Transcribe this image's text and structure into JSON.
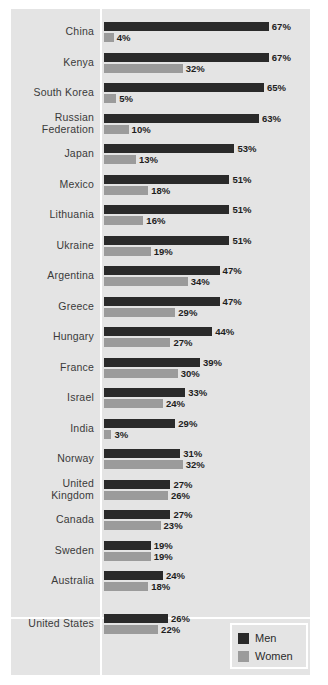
{
  "chart_data": {
    "type": "bar",
    "orientation": "horizontal",
    "title": "",
    "subtitle": "",
    "xlabel": "",
    "ylabel": "",
    "grid": false,
    "xlim": [
      0,
      70
    ],
    "value_suffix": "%",
    "legend_position": "bottom-right",
    "categories": [
      "China",
      "Kenya",
      "South Korea",
      "Russian Federation",
      "Japan",
      "Mexico",
      "Lithuania",
      "Ukraine",
      "Argentina",
      "Greece",
      "Hungary",
      "France",
      "Israel",
      "India",
      "Norway",
      "United Kingdom",
      "Canada",
      "Sweden",
      "Australia",
      "United States"
    ],
    "series": [
      {
        "name": "Men",
        "color": "#2a2a2a",
        "values": [
          67,
          67,
          65,
          63,
          53,
          51,
          51,
          51,
          47,
          47,
          44,
          39,
          33,
          29,
          31,
          27,
          27,
          19,
          24,
          26
        ]
      },
      {
        "name": "Women",
        "color": "#9b9b9b",
        "values": [
          4,
          32,
          5,
          10,
          13,
          18,
          16,
          19,
          34,
          29,
          27,
          30,
          24,
          3,
          32,
          26,
          23,
          19,
          18,
          22
        ]
      }
    ]
  },
  "rows": [
    {
      "label_lines": [
        "China"
      ],
      "men": "67%",
      "women": "4%"
    },
    {
      "label_lines": [
        "Kenya"
      ],
      "men": "67%",
      "women": "32%"
    },
    {
      "label_lines": [
        "South Korea"
      ],
      "men": "65%",
      "women": "5%"
    },
    {
      "label_lines": [
        "Russian",
        "Federation"
      ],
      "men": "63%",
      "women": "10%"
    },
    {
      "label_lines": [
        "Japan"
      ],
      "men": "53%",
      "women": "13%"
    },
    {
      "label_lines": [
        "Mexico"
      ],
      "men": "51%",
      "women": "18%"
    },
    {
      "label_lines": [
        "Lithuania"
      ],
      "men": "51%",
      "women": "16%"
    },
    {
      "label_lines": [
        "Ukraine"
      ],
      "men": "51%",
      "women": "19%"
    },
    {
      "label_lines": [
        "Argentina"
      ],
      "men": "47%",
      "women": "34%"
    },
    {
      "label_lines": [
        "Greece"
      ],
      "men": "47%",
      "women": "29%"
    },
    {
      "label_lines": [
        "Hungary"
      ],
      "men": "44%",
      "women": "27%"
    },
    {
      "label_lines": [
        "France"
      ],
      "men": "39%",
      "women": "30%"
    },
    {
      "label_lines": [
        "Israel"
      ],
      "men": "33%",
      "women": "24%"
    },
    {
      "label_lines": [
        "India"
      ],
      "men": "29%",
      "women": "3%"
    },
    {
      "label_lines": [
        "Norway"
      ],
      "men": "31%",
      "women": "32%"
    },
    {
      "label_lines": [
        "United",
        "Kingdom"
      ],
      "men": "27%",
      "women": "26%"
    },
    {
      "label_lines": [
        "Canada"
      ],
      "men": "27%",
      "women": "23%"
    },
    {
      "label_lines": [
        "Sweden"
      ],
      "men": "19%",
      "women": "19%"
    },
    {
      "label_lines": [
        "Australia"
      ],
      "men": "24%",
      "women": "18%"
    },
    {
      "label_lines": [
        "United States"
      ],
      "men": "26%",
      "women": "22%"
    }
  ],
  "legend": {
    "men_label": "Men",
    "women_label": "Women"
  },
  "colors": {
    "men_bar": "#2a2a2a",
    "women_bar": "#9b9b9b",
    "panel_background": "#e4e4e4",
    "page_background": "#ffffff",
    "divider": "#ffffff",
    "label_text": "#3a3a3a",
    "value_text": "#1e1e1e"
  }
}
